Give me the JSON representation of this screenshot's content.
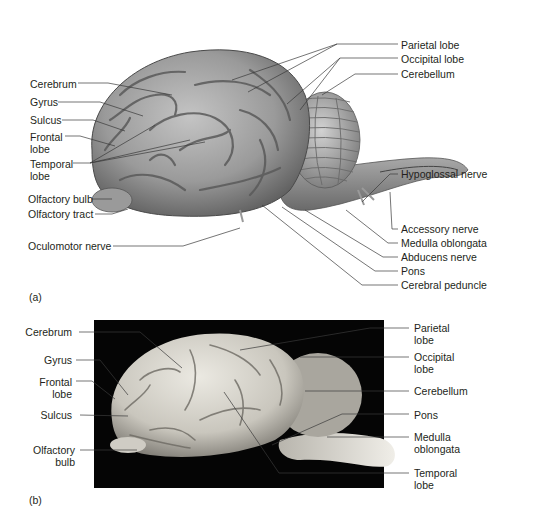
{
  "panel_a": {
    "tag": "(a)",
    "labels_left": [
      {
        "text": "Cerebrum"
      },
      {
        "text": "Gyrus"
      },
      {
        "text": "Sulcus"
      },
      {
        "text": "Frontal\nlobe",
        "line1": "Frontal",
        "line2": "lobe"
      },
      {
        "text": "Temporal lobe",
        "line1": "Temporal",
        "line2": "lobe"
      },
      {
        "text": "Olfactory bulb"
      },
      {
        "text": "Olfactory tract"
      },
      {
        "text": "Oculomotor nerve"
      }
    ],
    "labels_right": [
      {
        "text": "Parietal lobe"
      },
      {
        "text": "Occipital lobe"
      },
      {
        "text": "Cerebellum"
      },
      {
        "text": "Hypoglossal nerve"
      },
      {
        "text": "Accessory nerve"
      },
      {
        "text": "Medulla oblongata"
      },
      {
        "text": "Abducens nerve"
      },
      {
        "text": "Pons"
      },
      {
        "text": "Cerebral peduncle"
      }
    ]
  },
  "panel_b": {
    "tag": "(b)",
    "labels_left": [
      {
        "text": "Cerebrum"
      },
      {
        "text": "Gyrus"
      },
      {
        "line1": "Frontal",
        "line2": "lobe"
      },
      {
        "text": "Sulcus"
      },
      {
        "line1": "Olfactory",
        "line2": "bulb"
      }
    ],
    "labels_right": [
      {
        "line1": "Parietal",
        "line2": "lobe"
      },
      {
        "line1": "Occipital",
        "line2": "lobe"
      },
      {
        "text": "Cerebellum"
      },
      {
        "text": "Pons"
      },
      {
        "line1": "Medulla",
        "line2": "oblongata"
      },
      {
        "line1": "Temporal",
        "line2": "lobe"
      }
    ]
  },
  "colors": {
    "background": "#ffffff",
    "text": "#231f20",
    "leader_line": "#3a3a3a",
    "photo_background": "#050505",
    "brain_illustration": "#8c8c8c",
    "brain_photo": "#d8d6cf"
  }
}
